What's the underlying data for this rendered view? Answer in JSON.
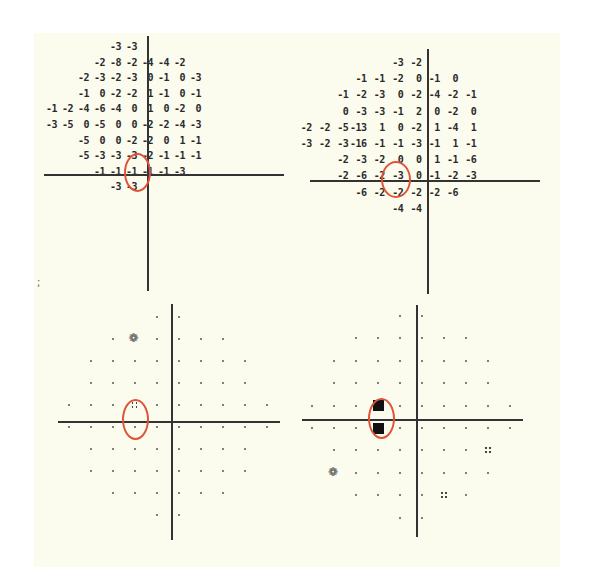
{
  "chart_data": [
    {
      "type": "table",
      "title": "Total deviation (left eye)",
      "rows": [
        {
          "cols": [
            4,
            5
          ],
          "values": [
            "-3",
            "-3"
          ]
        },
        {
          "cols": [
            3,
            4,
            5,
            6,
            7,
            8
          ],
          "values": [
            "-2",
            "-8",
            "-2",
            "-4",
            "-4",
            "-2"
          ]
        },
        {
          "cols": [
            2,
            3,
            4,
            5,
            6,
            7,
            8,
            9
          ],
          "values": [
            "-2",
            "-3",
            "-2",
            "-3",
            "0",
            "-1",
            "0",
            "-3"
          ]
        },
        {
          "cols": [
            2,
            3,
            4,
            5,
            6,
            7,
            8,
            9
          ],
          "values": [
            "-1",
            "0",
            "-2",
            "-2",
            "1",
            "-1",
            "0",
            "-1"
          ]
        },
        {
          "cols": [
            0,
            1,
            2,
            3,
            4,
            5,
            6,
            7,
            8,
            9
          ],
          "values": [
            "-1",
            "-2",
            "-4",
            "-6",
            "-4",
            "0",
            "1",
            "0",
            "-2",
            "0"
          ]
        },
        {
          "cols": [
            0,
            1,
            2,
            3,
            4,
            5,
            6,
            7,
            8,
            9
          ],
          "values": [
            "-3",
            "-5",
            "0",
            "-5",
            "0",
            "0",
            "-2",
            "-2",
            "-4",
            "-3"
          ]
        },
        {
          "cols": [
            2,
            3,
            4,
            5,
            6,
            7,
            8,
            9
          ],
          "values": [
            "-5",
            "0",
            "0",
            "-2",
            "-2",
            "0",
            "1",
            "-1"
          ]
        },
        {
          "cols": [
            2,
            3,
            4,
            5,
            6,
            7,
            8,
            9
          ],
          "values": [
            "-5",
            "-3",
            "-3",
            "-3",
            "-2",
            "-1",
            "-1",
            "-1"
          ]
        },
        {
          "cols": [
            3,
            4,
            5,
            6,
            7,
            8
          ],
          "values": [
            "-1",
            "-1",
            "-1",
            "-1",
            "-1",
            "-3"
          ]
        },
        {
          "cols": [
            4,
            5
          ],
          "values": [
            "-3",
            "-3"
          ]
        }
      ],
      "highlighted": [
        {
          "row": 4,
          "col": 3,
          "value": "-6"
        },
        {
          "row": 5,
          "col": 3,
          "value": "-5"
        }
      ]
    },
    {
      "type": "table",
      "title": "Total deviation (right eye)",
      "rows": [
        {
          "cols": [
            4,
            5
          ],
          "values": [
            "-3",
            "-2"
          ]
        },
        {
          "cols": [
            2,
            3,
            4,
            5,
            6,
            7
          ],
          "values": [
            "-1",
            "-1",
            "-2",
            "0",
            "-1",
            "0"
          ]
        },
        {
          "cols": [
            1,
            2,
            3,
            4,
            5,
            6,
            7,
            8
          ],
          "values": [
            "-1",
            "-2",
            "-3",
            "0",
            "-2",
            "-4",
            "-2",
            "-1"
          ]
        },
        {
          "cols": [
            1,
            2,
            3,
            4,
            5,
            6,
            7,
            8
          ],
          "values": [
            "0",
            "-3",
            "-3",
            "-1",
            "2",
            "0",
            "-2",
            "0"
          ]
        },
        {
          "cols": [
            -1,
            0,
            1,
            2,
            3,
            4,
            5,
            6,
            7,
            8
          ],
          "values": [
            "-2",
            "-2",
            "-5",
            "-13",
            "1",
            "0",
            "-2",
            "1",
            "-4",
            "1"
          ]
        },
        {
          "cols": [
            -1,
            0,
            1,
            2,
            3,
            4,
            5,
            6,
            7,
            8
          ],
          "values": [
            "-3",
            "-2",
            "-3",
            "-16",
            "-1",
            "-1",
            "-3",
            "-1",
            "1",
            "-1"
          ]
        },
        {
          "cols": [
            1,
            2,
            3,
            4,
            5,
            6,
            7,
            8
          ],
          "values": [
            "-2",
            "-3",
            "-2",
            "0",
            "0",
            "1",
            "-1",
            "-6"
          ]
        },
        {
          "cols": [
            1,
            2,
            3,
            4,
            5,
            6,
            7,
            8
          ],
          "values": [
            "-2",
            "-6",
            "-2",
            "-3",
            "0",
            "-1",
            "-2",
            "-3"
          ]
        },
        {
          "cols": [
            2,
            3,
            4,
            5,
            6,
            7
          ],
          "values": [
            "-6",
            "-2",
            "-2",
            "-2",
            "-2",
            "-6"
          ]
        },
        {
          "cols": [
            4,
            5
          ],
          "values": [
            "-4",
            "-4"
          ]
        }
      ],
      "highlighted": [
        {
          "row": 4,
          "col": 2,
          "value": "-13"
        },
        {
          "row": 5,
          "col": 2,
          "value": "-16"
        }
      ]
    },
    {
      "type": "scatter",
      "title": "Probability plot (left eye)",
      "symbols": {
        "dot": "normal",
        "four_dot": "p<5%",
        "checker": "p<2%"
      },
      "cells": [
        {
          "row": 1,
          "col": 3,
          "symbol": "checker"
        },
        {
          "row": 4,
          "col": 3,
          "symbol": "four_dot"
        }
      ],
      "highlighted": [
        {
          "row": 4,
          "col": 3
        },
        {
          "row": 5,
          "col": 3
        }
      ]
    },
    {
      "type": "scatter",
      "title": "Probability plot (right eye)",
      "symbols": {
        "dot": "normal",
        "four_dot": "p<5%",
        "checker": "p<2%",
        "dense": "p<1%",
        "block": "p<0.5%"
      },
      "cells": [
        {
          "row": 4,
          "col": 3,
          "symbol": "block"
        },
        {
          "row": 5,
          "col": 3,
          "symbol": "block"
        },
        {
          "row": 6,
          "col": 8,
          "symbol": "four_dot"
        },
        {
          "row": 7,
          "col": 1,
          "symbol": "checker"
        },
        {
          "row": 8,
          "col": 1,
          "symbol": "dense"
        },
        {
          "row": 8,
          "col": 6,
          "symbol": "four_dot"
        }
      ],
      "highlighted": [
        {
          "row": 4,
          "col": 3
        },
        {
          "row": 5,
          "col": 3
        }
      ]
    }
  ],
  "margin_mark": ";",
  "colors": {
    "paper": "#fbfbee",
    "ink": "#2a2a2a",
    "highlight": "#e0533a"
  }
}
